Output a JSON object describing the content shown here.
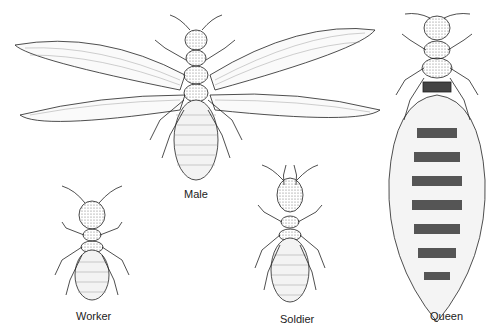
{
  "figure": {
    "castes": [
      {
        "name": "male",
        "label": "Male"
      },
      {
        "name": "worker",
        "label": "Worker"
      },
      {
        "name": "soldier",
        "label": "Soldier"
      },
      {
        "name": "queen",
        "label": "Queen"
      }
    ]
  }
}
